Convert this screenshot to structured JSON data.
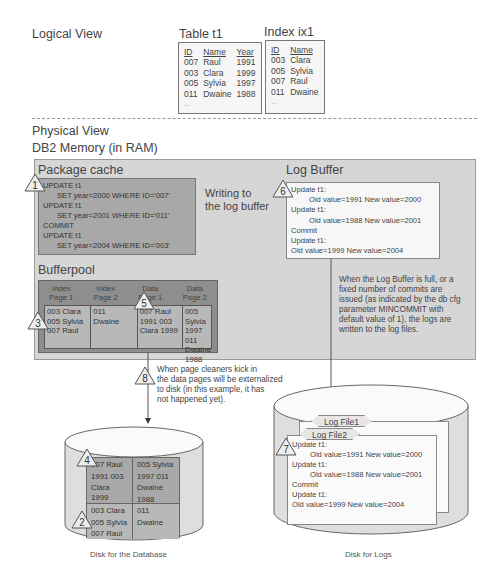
{
  "logical_view": {
    "label": "Logical View",
    "table": {
      "title": "Table t1",
      "headers": [
        "ID",
        "Name",
        "Year"
      ],
      "rows": [
        [
          "007",
          "Raul",
          "1991"
        ],
        [
          "003",
          "Clara",
          "1999"
        ],
        [
          "005",
          "Sylvia",
          "1997"
        ],
        [
          "011",
          "Dwaine",
          "1988"
        ]
      ],
      "ellipsis": "..."
    },
    "index": {
      "title": "Index ix1",
      "headers": [
        "ID",
        "Name"
      ],
      "rows": [
        [
          "003",
          "Clara"
        ],
        [
          "005",
          "Sylvia"
        ],
        [
          "007",
          "Raul"
        ],
        [
          "011",
          "Dwaine"
        ]
      ],
      "ellipsis": "..."
    }
  },
  "physical_view": {
    "label": "Physical View",
    "memory_label": "DB2 Memory (in RAM)",
    "package_cache": {
      "title": "Package cache",
      "step": "1",
      "lines": [
        "UPDATE t1",
        "SET year=2000 WHERE ID='007'",
        "UPDATE t1",
        "SET year=2001 WHERE ID='011'",
        "COMMIT",
        "UPDATE t1",
        "SET year=2004 WHERE ID='003'"
      ]
    },
    "writing_label": [
      "Writing to",
      "the log buffer"
    ],
    "log_buffer": {
      "title": "Log Buffer",
      "step": "6",
      "lines": [
        "Update t1:",
        "Old value=1991 New value=2000",
        "Update t1:",
        "Old value=1988 New value=2001",
        "Commit",
        "Update t1:",
        "Old value=1999 New value=2004"
      ],
      "note": [
        "When the Log Buffer is full, or a",
        "fixed number of commits are",
        "issued (as indicated by the db cfg",
        "parameter MINCOMMIT with",
        "default value of 1), the logs are",
        "written to the log files."
      ]
    },
    "bufferpool": {
      "title": "Bufferpool",
      "step_index": "3",
      "step_data": "5",
      "headers": [
        [
          "Index",
          "Page 1"
        ],
        [
          "Index",
          "Page 2"
        ],
        [
          "Data",
          "Page 1"
        ],
        [
          "Data",
          "Page 2"
        ]
      ],
      "cells": [
        [
          "003  Clara",
          "005  Sylvia",
          "007  Raul"
        ],
        [
          "011",
          "Dwaine"
        ],
        [
          "007      Raul",
          "1991  003",
          "Clara  1999"
        ],
        [
          "005  Sylvia",
          "1997  011",
          "Dwaine",
          "1988"
        ]
      ]
    },
    "page_cleaner_note": {
      "step": "8",
      "lines": [
        "When page cleaners kick in",
        "the data pages will be externalized",
        "to disk (in this example, it has",
        "not happened yet)."
      ]
    },
    "disk_db": {
      "label": "Disk for the Database",
      "step_data": "4",
      "step_index": "2",
      "cells": [
        [
          "007      Raul",
          "1991   003",
          "Clara  1999"
        ],
        [
          "005   Sylvia",
          "1997    011",
          "Dwaine",
          "1988"
        ],
        [
          "003  Clara",
          "005  Sylvia",
          "007  Raul"
        ],
        [
          "011",
          "Dwaine"
        ]
      ]
    },
    "disk_logs": {
      "label": "Disk for Logs",
      "step": "7",
      "file1": "Log File1",
      "file2": "Log File2",
      "lines": [
        "Update t1:",
        "Old value=1991 New value=2000",
        "Update t1:",
        "Old value=1988 New value=2001",
        "Commit",
        "Update t1:",
        "Old value=1999 New value=2004"
      ]
    }
  },
  "colors": {
    "memory_bg": "#d6d6d6",
    "package_cache_bg": "#a8a8a8",
    "bufferpool_bg": "#8e8e8e",
    "log_buffer_bg": "#f7f7f7"
  }
}
